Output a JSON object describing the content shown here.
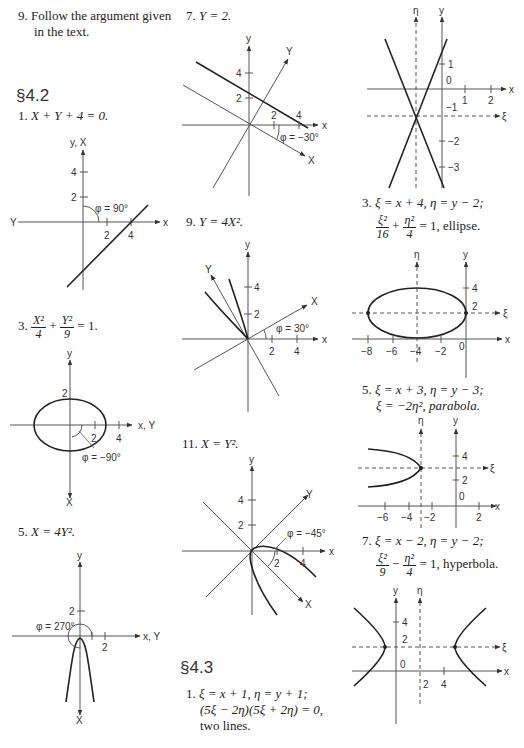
{
  "left_column": {
    "item9": {
      "number": "9.",
      "line1": "Follow the argument given",
      "line2": "in the text."
    },
    "section_4_2": "§4.2",
    "item1": {
      "number": "1.",
      "equation": "X + Y + 4 = 0.",
      "graph": {
        "y_label": "y, X",
        "x_label": "x",
        "neg_label": "Y",
        "ticks_y": [
          "4",
          "2"
        ],
        "ticks_x": [
          "2",
          "4"
        ],
        "angle": "φ = 90°"
      }
    },
    "item3": {
      "number": "3.",
      "frac1_num": "X²",
      "frac1_den": "4",
      "plus": "+",
      "frac2_num": "Y²",
      "frac2_den": "9",
      "rhs": "= 1.",
      "graph": {
        "y_label": "y",
        "x_label": "x, Y",
        "neg_label": "X",
        "ticks_y": [
          "2"
        ],
        "ticks_x": [
          "2",
          "4"
        ],
        "angle": "φ = −90°"
      }
    },
    "item5": {
      "number": "5.",
      "equation": "X = 4Y².",
      "graph": {
        "y_label": "y",
        "x_label": "x, Y",
        "neg_label": "X",
        "ticks_y": [
          "2"
        ],
        "ticks_x": [
          "2"
        ],
        "angle": "φ = 270°"
      }
    }
  },
  "middle_column": {
    "item7": {
      "number": "7.",
      "equation": "Y = 2.",
      "graph": {
        "y_label": "y",
        "x_label": "x",
        "rot_y_label": "Y",
        "rot_x_label": "X",
        "ticks_y": [
          "4",
          "2"
        ],
        "ticks_x": [
          "2",
          "4"
        ],
        "angle": "φ = −30°"
      }
    },
    "item9": {
      "number": "9.",
      "equation": "Y = 4X².",
      "graph": {
        "y_label": "y",
        "x_label": "x",
        "rot_y_label": "Y",
        "rot_x_label": "X",
        "ticks_y": [
          "4",
          "2"
        ],
        "ticks_x": [
          "2",
          "4"
        ],
        "angle": "φ = 30°"
      }
    },
    "item11": {
      "number": "11.",
      "equation": "X = Y².",
      "graph": {
        "y_label": "y",
        "x_label": "x",
        "rot_y_label": "Y",
        "rot_x_label": "X",
        "ticks_y": [
          "4",
          "2"
        ],
        "ticks_x": [
          "2",
          "4"
        ],
        "angle": "φ = −45°"
      }
    },
    "section_4_3": "§4.3",
    "item1": {
      "number": "1.",
      "line1": "ξ = x + 1,   η = y + 1;",
      "line2": "(5ξ − 2η)(5ξ + 2η) = 0,",
      "line3": "two lines."
    }
  },
  "right_column": {
    "graph_two_lines": {
      "eta_label": "η",
      "y_label": "y",
      "x_label": "x",
      "xi_label": "ξ",
      "ticks_y": [
        "1",
        "0",
        "−1",
        "−2",
        "−3"
      ],
      "ticks_x": [
        "1",
        "2"
      ]
    },
    "item3": {
      "number": "3.",
      "line1": "ξ = x + 4,   η = y − 2;",
      "frac1_num": "ξ²",
      "frac1_den": "16",
      "plus": "+",
      "frac2_num": "η²",
      "frac2_den": "4",
      "rhs": "= 1,   ellipse.",
      "graph": {
        "eta_label": "η",
        "y_label": "y",
        "x_label": "x",
        "xi_label": "ξ",
        "ticks_y": [
          "4",
          "2"
        ],
        "ticks_x": [
          "−8",
          "−6",
          "−4",
          "−2",
          "0"
        ]
      }
    },
    "item5": {
      "number": "5.",
      "line1": "ξ = x + 3,   η = y − 3;",
      "line2": "ξ = −2η²,   parabola.",
      "graph": {
        "eta_label": "η",
        "y_label": "y",
        "x_label": "x",
        "xi_label": "ξ",
        "ticks_y": [
          "4",
          "2",
          "0"
        ],
        "ticks_x": [
          "−6",
          "−4",
          "−2",
          "2"
        ]
      }
    },
    "item7": {
      "number": "7.",
      "line1": "ξ = x − 2,   η = y − 2;",
      "frac1_num": "ξ²",
      "frac1_den": "9",
      "minus": "−",
      "frac2_num": "η²",
      "frac2_den": "4",
      "rhs": "= 1,   hyperbola.",
      "graph": {
        "eta_label": "η",
        "y_label": "y",
        "x_label": "x",
        "xi_label": "ξ",
        "ticks_y": [
          "4",
          "2",
          "0"
        ],
        "ticks_x": [
          "2",
          "4"
        ]
      }
    }
  }
}
